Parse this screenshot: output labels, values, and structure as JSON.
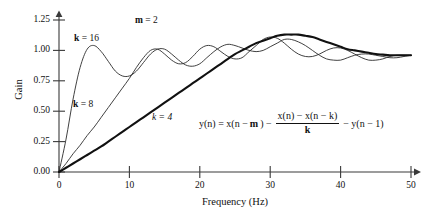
{
  "chart_data": {
    "type": "line",
    "title": "",
    "xlabel": "Frequency (Hz)",
    "ylabel": "Gain",
    "xlim": [
      0,
      50
    ],
    "ylim": [
      0.0,
      1.25
    ],
    "grid": false,
    "legend_position": "inline-annotations",
    "xticks": [
      "0",
      "10",
      "20",
      "30",
      "40",
      "50"
    ],
    "yticks": [
      "0.00",
      "0.25",
      "0.50",
      "0.75",
      "1.00",
      "1.25"
    ],
    "annotations": [
      {
        "name": "k16-label",
        "text": "k = 16",
        "x": 5,
        "y": 1.14
      },
      {
        "name": "k8-label",
        "text": "k = 8",
        "x": 5,
        "y": 0.62
      },
      {
        "name": "k4-label",
        "text": "k = 4",
        "x": 16,
        "y": 0.52
      },
      {
        "name": "m-label",
        "text": "m = 2",
        "x": 13,
        "y": 1.28
      },
      {
        "name": "equation",
        "text": "y(n) = x(n - m) - [x(n) - x(n - k)] / k - y(n - 1)"
      }
    ],
    "series": [
      {
        "name": "k = 16",
        "style": "thin",
        "x": [
          0,
          1,
          2,
          3,
          4,
          5,
          6,
          7,
          8,
          9,
          10,
          11,
          12,
          13,
          14,
          15,
          16,
          17,
          18,
          19,
          20,
          21,
          22,
          23,
          24,
          25,
          26,
          27,
          28,
          29,
          30,
          31,
          32,
          33,
          34,
          35,
          36,
          37,
          38,
          39,
          40,
          41,
          42,
          43,
          44,
          45,
          46,
          47,
          48,
          49,
          50
        ],
        "values": [
          0.0,
          0.27,
          0.6,
          0.86,
          1.01,
          1.04,
          0.99,
          0.91,
          0.83,
          0.79,
          0.79,
          0.83,
          0.9,
          0.97,
          1.01,
          1.01,
          0.97,
          0.92,
          0.88,
          0.87,
          0.89,
          0.94,
          0.99,
          1.03,
          1.05,
          1.04,
          1.02,
          1.0,
          0.99,
          1.0,
          1.03,
          1.06,
          1.09,
          1.09,
          1.07,
          1.04,
          1.0,
          0.96,
          0.93,
          0.92,
          0.92,
          0.94,
          0.96,
          0.97,
          0.97,
          0.96,
          0.95,
          0.94,
          0.94,
          0.95,
          0.96
        ]
      },
      {
        "name": "k = 8",
        "style": "thin",
        "x": [
          0,
          1,
          2,
          3,
          4,
          5,
          6,
          7,
          8,
          9,
          10,
          11,
          12,
          13,
          14,
          15,
          16,
          17,
          18,
          19,
          20,
          21,
          22,
          23,
          24,
          25,
          26,
          27,
          28,
          29,
          30,
          31,
          32,
          33,
          34,
          35,
          36,
          37,
          38,
          39,
          40,
          41,
          42,
          43,
          44,
          45,
          46,
          47,
          48,
          49,
          50
        ],
        "values": [
          0.0,
          0.07,
          0.15,
          0.22,
          0.3,
          0.37,
          0.45,
          0.53,
          0.61,
          0.69,
          0.77,
          0.86,
          0.94,
          1.0,
          1.01,
          0.97,
          0.92,
          0.89,
          0.9,
          0.95,
          1.01,
          1.04,
          1.03,
          0.99,
          0.95,
          0.93,
          0.94,
          0.99,
          1.04,
          1.09,
          1.11,
          1.1,
          1.06,
          1.01,
          0.97,
          0.95,
          0.95,
          0.97,
          1.0,
          1.02,
          1.02,
          1.0,
          0.97,
          0.94,
          0.92,
          0.92,
          0.93,
          0.95,
          0.96,
          0.96,
          0.96
        ]
      },
      {
        "name": "k = 4",
        "style": "thick",
        "x": [
          0,
          1,
          2,
          3,
          4,
          5,
          6,
          7,
          8,
          9,
          10,
          11,
          12,
          13,
          14,
          15,
          16,
          17,
          18,
          19,
          20,
          21,
          22,
          23,
          24,
          25,
          26,
          27,
          28,
          29,
          30,
          31,
          32,
          33,
          34,
          35,
          36,
          37,
          38,
          39,
          40,
          41,
          42,
          43,
          44,
          45,
          46,
          47,
          48,
          49,
          50
        ],
        "values": [
          0.0,
          0.035,
          0.07,
          0.105,
          0.14,
          0.175,
          0.21,
          0.25,
          0.29,
          0.33,
          0.37,
          0.41,
          0.45,
          0.49,
          0.53,
          0.57,
          0.61,
          0.65,
          0.69,
          0.73,
          0.77,
          0.81,
          0.85,
          0.89,
          0.93,
          0.97,
          1.0,
          1.03,
          1.06,
          1.08,
          1.1,
          1.12,
          1.13,
          1.13,
          1.13,
          1.12,
          1.11,
          1.09,
          1.07,
          1.05,
          1.03,
          1.01,
          1.0,
          0.99,
          0.98,
          0.97,
          0.965,
          0.96,
          0.96,
          0.96,
          0.96
        ]
      }
    ]
  },
  "axes": {
    "y_title": "Gain",
    "x_title": "Frequency (Hz)"
  },
  "labels": {
    "k16": {
      "var": "k",
      "rest": " = 16"
    },
    "k8": {
      "var": "k",
      "rest": " = 8"
    },
    "k4": {
      "var": "k",
      "rest": " = 4"
    },
    "m": {
      "var": "m",
      "rest": " = 2"
    }
  },
  "equation": {
    "lhs": "y(n) = x(n − ",
    "m_var": "m",
    "after_m": ") − ",
    "numerator": "x(n) − x(n − k)",
    "denominator": "k",
    "tail": "− y(n − 1)"
  },
  "style": {
    "axis_color": "#3a3a3a",
    "curve_color": "#2b2b2b",
    "thick_curve_color": "#111111",
    "background": "#ffffff"
  }
}
